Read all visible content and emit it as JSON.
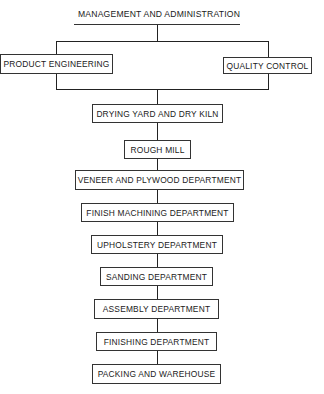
{
  "diagram": {
    "type": "organization-flow-chart",
    "top": {
      "label": "MANAGEMENT AND ADMINISTRATION"
    },
    "staff": [
      {
        "label": "PRODUCT ENGINEERING",
        "side": "left"
      },
      {
        "label": "QUALITY CONTROL",
        "side": "right"
      }
    ],
    "flow": [
      {
        "label": "DRYING YARD AND DRY KILN"
      },
      {
        "label": "ROUGH MILL"
      },
      {
        "label": "VENEER AND PLYWOOD DEPARTMENT"
      },
      {
        "label": "FINISH MACHINING DEPARTMENT"
      },
      {
        "label": "UPHOLSTERY DEPARTMENT"
      },
      {
        "label": "SANDING DEPARTMENT"
      },
      {
        "label": "ASSEMBLY DEPARTMENT"
      },
      {
        "label": "FINISHING DEPARTMENT"
      },
      {
        "label": "PACKING AND WAREHOUSE"
      }
    ],
    "colors": {
      "line": "#222222",
      "background": "#ffffff",
      "text": "#1a1a1a"
    }
  }
}
